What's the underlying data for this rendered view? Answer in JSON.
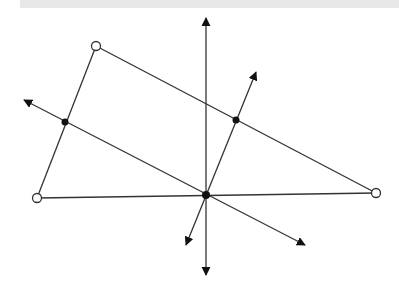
{
  "diagram": {
    "stroke_color": "#333333",
    "open_point_fill": "#ffffff",
    "filled_point_fill": "#111111",
    "vertices": [
      {
        "id": "A",
        "x": 96,
        "y": 46
      },
      {
        "id": "B",
        "x": 37,
        "y": 198
      },
      {
        "id": "C",
        "x": 376,
        "y": 193
      }
    ],
    "midpoints": [
      {
        "id": "M_AB",
        "x": 65,
        "y": 122
      },
      {
        "id": "M_AC",
        "x": 236,
        "y": 120
      }
    ],
    "circumcenter": {
      "id": "O",
      "x": 206,
      "y": 195
    },
    "bisector_lines": [
      {
        "id": "bisector-BC",
        "x1": 206,
        "y1": 18,
        "x2": 206,
        "y2": 275
      },
      {
        "id": "bisector-AB",
        "x1": 24,
        "y1": 100,
        "x2": 305,
        "y2": 245
      },
      {
        "id": "bisector-AC",
        "x1": 256,
        "y1": 72,
        "x2": 186,
        "y2": 245
      }
    ]
  }
}
